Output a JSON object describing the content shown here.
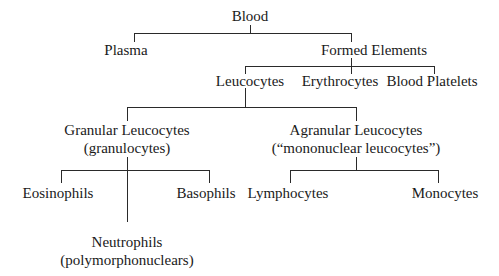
{
  "diagram": {
    "type": "tree",
    "root": {
      "label": "Blood",
      "children": [
        {
          "label": "Plasma"
        },
        {
          "label": "Formed Elements",
          "children": [
            {
              "label": "Leucocytes",
              "children": [
                {
                  "label": "Granular Leucocytes",
                  "sublabel": "(granulocytes)",
                  "children": [
                    {
                      "label": "Eosinophils"
                    },
                    {
                      "label": "Neutrophils",
                      "sublabel": "(polymorphonuclears)"
                    },
                    {
                      "label": "Basophils"
                    }
                  ]
                },
                {
                  "label": "Agranular Leucocytes",
                  "sublabel": "(“mononuclear leucocytes”)",
                  "children": [
                    {
                      "label": "Lymphocytes"
                    },
                    {
                      "label": "Monocytes"
                    }
                  ]
                }
              ]
            },
            {
              "label": "Erythrocytes"
            },
            {
              "label": "Blood Platelets"
            }
          ]
        }
      ]
    }
  },
  "nodes": {
    "blood": "Blood",
    "plasma": "Plasma",
    "formed_elements": "Formed Elements",
    "leucocytes": "Leucocytes",
    "erythrocytes": "Erythrocytes",
    "blood_platelets": "Blood Platelets",
    "granular": {
      "label": "Granular Leucocytes",
      "sublabel": "(granulocytes)"
    },
    "agranular": {
      "label": "Agranular Leucocytes",
      "sublabel": "(“mononuclear leucocytes”)"
    },
    "eosinophils": "Eosinophils",
    "basophils": "Basophils",
    "neutrophils": {
      "label": "Neutrophils",
      "sublabel": "(polymorphonuclears)"
    },
    "lymphocytes": "Lymphocytes",
    "monocytes": "Monocytes"
  },
  "colors": {
    "background": "#ffffff",
    "text": "#1a1a1a",
    "lines": "#2a2a2a"
  }
}
